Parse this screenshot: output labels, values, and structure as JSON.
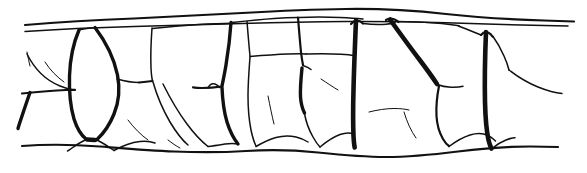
{
  "figure": {
    "description": "Monochrome ink line drawing of a horizontal band of irregular polygonal cells bounded above by a doubled (paired) cuticle line and below by a single undulating wall line.",
    "media": "ink line drawing",
    "colors": {
      "background": "#ffffff",
      "ink": "#111111"
    },
    "canvas": {
      "width": 587,
      "height": 173
    },
    "stroke_weights": {
      "hairline": 1.0,
      "thin": 1.5,
      "medium": 2.2,
      "thick": 3.4,
      "extra_thick": 4.6
    },
    "structure": {
      "top_boundary_label": "outer paired boundary line",
      "bottom_boundary_label": "inner single boundary line",
      "band_top_y": 18,
      "band_bottom_y": 152,
      "cell_count_visible": 17,
      "heavy_wall_count": 6
    }
  },
  "chart_data": {
    "type": "line-drawing",
    "paths": [
      {
        "name": "outer-boundary-upper",
        "weight": "medium",
        "d": "M 25 25 C 70 21, 120 19, 170 17 C 220 15, 265 13, 310 11 C 355 9, 400 11, 445 15 C 480 18, 520 20, 560 21 L 572 21"
      },
      {
        "name": "outer-boundary-lower",
        "weight": "thin",
        "d": "M 25 31 C 70 28, 120 26, 170 25 C 215 24, 260 23, 305 22 C 350 21, 400 21, 445 22 C 490 23, 530 24, 565 25"
      },
      {
        "name": "inner-boundary",
        "weight": "medium",
        "d": "M 22 146 C 60 143, 100 146, 140 149 C 180 152, 215 153, 250 151 C 285 149, 315 153, 350 155 C 390 157, 430 152, 470 149 C 505 146, 535 147, 560 148"
      },
      {
        "name": "wall-elongated-cell-left",
        "weight": "thick",
        "d": "M 77 30 C 71 48, 69 72, 71 95 C 73 116, 79 132, 88 140"
      },
      {
        "name": "wall-elongated-cell-right",
        "weight": "thick",
        "d": "M 96 28 C 108 46, 117 70, 118 94 C 119 116, 111 133, 97 141"
      },
      {
        "name": "wall-vertical-mid-left",
        "weight": "med",
        "d": "M 155 28 C 153 48, 152 62, 153 74"
      },
      {
        "name": "wall-diagonal-a",
        "weight": "thick",
        "d": "M 228 24 C 232 50, 234 74, 236 96 C 238 118, 242 134, 248 144"
      },
      {
        "name": "wall-vertical-right-a",
        "weight": "xthick",
        "d": "M 358 27 C 356 55, 354 85, 353 112 C 352 128, 352 138, 352 144"
      },
      {
        "name": "wall-diagonal-b",
        "weight": "xthick",
        "d": "M 389 19 C 404 43, 420 66, 435 86"
      },
      {
        "name": "wall-vertical-right-b",
        "weight": "xthick",
        "d": "M 487 32 C 486 60, 485 90, 486 114 C 487 128, 489 138, 492 145"
      }
    ]
  }
}
